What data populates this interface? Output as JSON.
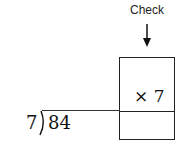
{
  "check": {
    "label": "Check",
    "arrow_icon": "down-arrow-icon",
    "multiplier": "× 7"
  },
  "division": {
    "divisor": "7",
    "dividend": "84",
    "quotient": ""
  }
}
